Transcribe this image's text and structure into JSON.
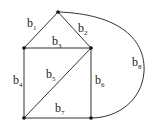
{
  "diagram": {
    "type": "graph",
    "nodes": [
      {
        "id": "top",
        "x": 58,
        "y": 12
      },
      {
        "id": "mid-left",
        "x": 24,
        "y": 48
      },
      {
        "id": "mid-right",
        "x": 91,
        "y": 48
      },
      {
        "id": "bottom-left",
        "x": 24,
        "y": 118
      },
      {
        "id": "bottom-right",
        "x": 91,
        "y": 118
      }
    ],
    "edges": [
      {
        "id": "b1",
        "base": "b",
        "sub": "1",
        "from": "top",
        "to": "mid-left",
        "lx": 27,
        "ly": 27
      },
      {
        "id": "b2",
        "base": "b",
        "sub": "2",
        "from": "top",
        "to": "mid-right",
        "lx": 78,
        "ly": 32
      },
      {
        "id": "b3",
        "base": "b",
        "sub": "3",
        "from": "mid-left",
        "to": "mid-right",
        "lx": 52,
        "ly": 45
      },
      {
        "id": "b4",
        "base": "b",
        "sub": "4",
        "from": "mid-left",
        "to": "bottom-left",
        "lx": 13,
        "ly": 84
      },
      {
        "id": "b5",
        "base": "b",
        "sub": "5",
        "from": "mid-right",
        "to": "bottom-left",
        "lx": 46,
        "ly": 78
      },
      {
        "id": "b6",
        "base": "b",
        "sub": "6",
        "from": "mid-right",
        "to": "bottom-right",
        "lx": 95,
        "ly": 84
      },
      {
        "id": "b7",
        "base": "b",
        "sub": "7",
        "from": "bottom-left",
        "to": "bottom-right",
        "lx": 55,
        "ly": 112
      },
      {
        "id": "b8",
        "base": "b",
        "sub": "8",
        "from": "top",
        "to": "bottom-right",
        "lx": 132,
        "ly": 66,
        "curved": true
      }
    ]
  }
}
